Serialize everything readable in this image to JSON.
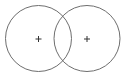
{
  "diagram": {
    "type": "venn",
    "circles": [
      {
        "id": "left",
        "cx": 38.5,
        "cy": 38.5,
        "r": 33,
        "center_marker": "+"
      },
      {
        "id": "right",
        "cx": 87,
        "cy": 38.5,
        "r": 33,
        "center_marker": "+"
      }
    ],
    "stroke_color": "#6e6e6e",
    "marker_color": "#333333"
  }
}
